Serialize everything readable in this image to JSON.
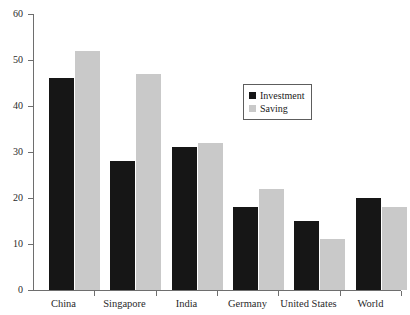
{
  "chart_data": {
    "type": "bar",
    "title": "",
    "subtitle": "",
    "xlabel": "",
    "ylabel": "",
    "categories": [
      "China",
      "Singapore",
      "India",
      "Germany",
      "United States",
      "World"
    ],
    "series": [
      {
        "name": "Investment",
        "color": "#161616",
        "values": [
          46,
          28,
          31,
          18,
          15,
          20
        ]
      },
      {
        "name": "Saving",
        "color": "#c9c9c9",
        "values": [
          52,
          47,
          32,
          22,
          11,
          18
        ]
      }
    ],
    "ylim": [
      0,
      60
    ],
    "ytick_values": [
      0,
      10,
      20,
      30,
      40,
      50,
      60
    ],
    "ytick_labels": [
      "0",
      "10",
      "20",
      "30",
      "40",
      "50",
      "60"
    ],
    "grid": false,
    "legend_position": "upper-center"
  },
  "legend": {
    "entries": [
      {
        "label": "Investment",
        "swatch": "investment"
      },
      {
        "label": "Saving",
        "swatch": "saving"
      }
    ]
  },
  "layout": {
    "plot_left": 33,
    "plot_right": 401,
    "plot_top": 14,
    "plot_bottom": 290,
    "group_count": 6,
    "bar_width": 25,
    "bar_gap": 1,
    "group_pad_left": 16,
    "legend_x": 243,
    "legend_y": 84
  }
}
